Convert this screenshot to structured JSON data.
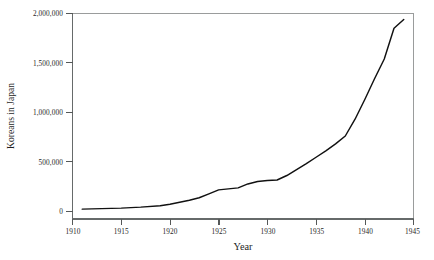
{
  "chart_data": {
    "type": "line",
    "title": "",
    "xlabel": "Year",
    "ylabel": "Koreans in Japan",
    "xlim": [
      1910,
      1945
    ],
    "ylim": [
      0,
      2000000
    ],
    "grid": false,
    "legend": "none",
    "x_ticks": [
      1910,
      1915,
      1920,
      1925,
      1930,
      1935,
      1940,
      1945
    ],
    "x_tick_labels": [
      "1910",
      "1915",
      "1920",
      "1925",
      "1930",
      "1935",
      "1940",
      "1945"
    ],
    "y_ticks": [
      0,
      500000,
      1000000,
      1500000,
      2000000
    ],
    "y_tick_labels": [
      "0",
      "500,000",
      "1,000,000",
      "1,500,000",
      "2,000,000"
    ],
    "series": [
      {
        "name": "Koreans in Japan",
        "color": "#111111",
        "x": [
          1911,
          1913,
          1915,
          1917,
          1919,
          1920,
          1921,
          1922,
          1923,
          1924,
          1925,
          1926,
          1927,
          1928,
          1929,
          1930,
          1931,
          1932,
          1933,
          1934,
          1935,
          1936,
          1937,
          1938,
          1939,
          1940,
          1941,
          1942,
          1943,
          1944
        ],
        "y": [
          20000,
          25000,
          30000,
          40000,
          55000,
          70000,
          90000,
          110000,
          135000,
          175000,
          215000,
          225000,
          235000,
          275000,
          300000,
          310000,
          315000,
          360000,
          420000,
          480000,
          545000,
          610000,
          680000,
          760000,
          930000,
          1130000,
          1340000,
          1540000,
          1850000,
          1940000
        ]
      }
    ]
  },
  "axes": {
    "x_title": "Year",
    "y_title": "Koreans in Japan"
  }
}
